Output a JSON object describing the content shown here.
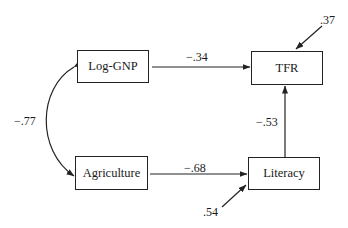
{
  "diagram": {
    "type": "path-diagram",
    "nodes": [
      {
        "id": "loggnp",
        "label": "Log-GNP"
      },
      {
        "id": "tfr",
        "label": "TFR"
      },
      {
        "id": "agriculture",
        "label": "Agriculture"
      },
      {
        "id": "literacy",
        "label": "Literacy"
      }
    ],
    "edges": [
      {
        "from": "Log-GNP",
        "to": "TFR",
        "label": "−.34"
      },
      {
        "from": "Agriculture",
        "to": "Literacy",
        "label": "−.68"
      },
      {
        "from": "Literacy",
        "to": "TFR",
        "label": "−.53"
      },
      {
        "from": "Log-GNP",
        "to": "Agriculture",
        "label": "−.77",
        "kind": "correlation"
      }
    ],
    "residuals": [
      {
        "to": "TFR",
        "label": ".37"
      },
      {
        "to": "Literacy",
        "label": ".54"
      }
    ],
    "colors": {
      "line": "#222222",
      "background": "#ffffff"
    }
  }
}
